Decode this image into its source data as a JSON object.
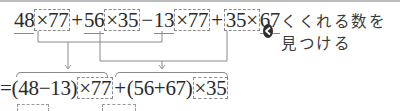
{
  "expression": {
    "terms": [
      {
        "a": "48",
        "times": "×",
        "b": "77"
      },
      {
        "op": "+",
        "a": "56",
        "times": "×",
        "b": "35"
      },
      {
        "op": "−",
        "a": "13",
        "times": "×",
        "b": "77"
      },
      {
        "op": "+",
        "a": "35",
        "times": "×",
        "b": "67"
      }
    ]
  },
  "hint": {
    "icon": "left-arrow-circle-icon",
    "text": "くくれる数を見つける"
  },
  "result": {
    "eq": "=",
    "group1": "(48−13)",
    "group1_mult": "×77",
    "plus": "+",
    "group2": "(56+67)",
    "group2_mult": "×35"
  },
  "colors": {
    "text": "#2a2a2a",
    "lines": "#8a8a8a",
    "arrow": "#9a9a9a"
  }
}
